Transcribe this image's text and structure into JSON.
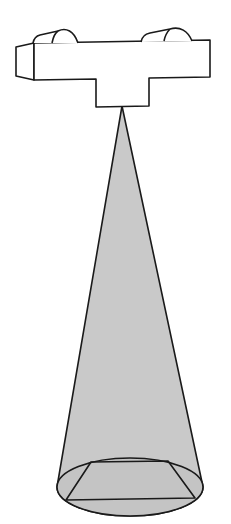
{
  "diagram": {
    "colors": {
      "background": "#ffffff",
      "stroke": "#1a1a1a",
      "cone_fill": "#c9c9c9",
      "body_fill": "#ffffff"
    },
    "components": [
      {
        "name": "satellite-body",
        "type": "box"
      },
      {
        "name": "sensor-housing",
        "type": "box"
      },
      {
        "name": "left-dome",
        "type": "dome"
      },
      {
        "name": "right-dome",
        "type": "dome"
      },
      {
        "name": "view-cone",
        "type": "cone"
      },
      {
        "name": "ground-footprint",
        "type": "ellipse"
      },
      {
        "name": "swath-trapezoid",
        "type": "polygon"
      }
    ]
  }
}
